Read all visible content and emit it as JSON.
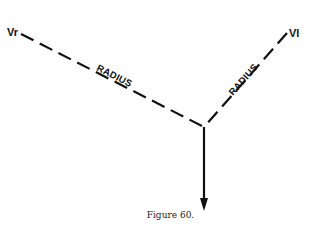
{
  "figure": {
    "caption": "Figure 60.",
    "labels": {
      "left_vector": "Vr",
      "right_vector": "Vl",
      "left_radius": "RADIUS",
      "right_radius": "RADIUS"
    },
    "geometry": {
      "vertex": [
        204,
        127
      ],
      "left_end": [
        21,
        34
      ],
      "right_end": [
        287,
        33
      ],
      "arrow_end": [
        204,
        210
      ]
    },
    "colors": {
      "ink": "#111111",
      "background": "#ffffff"
    }
  }
}
